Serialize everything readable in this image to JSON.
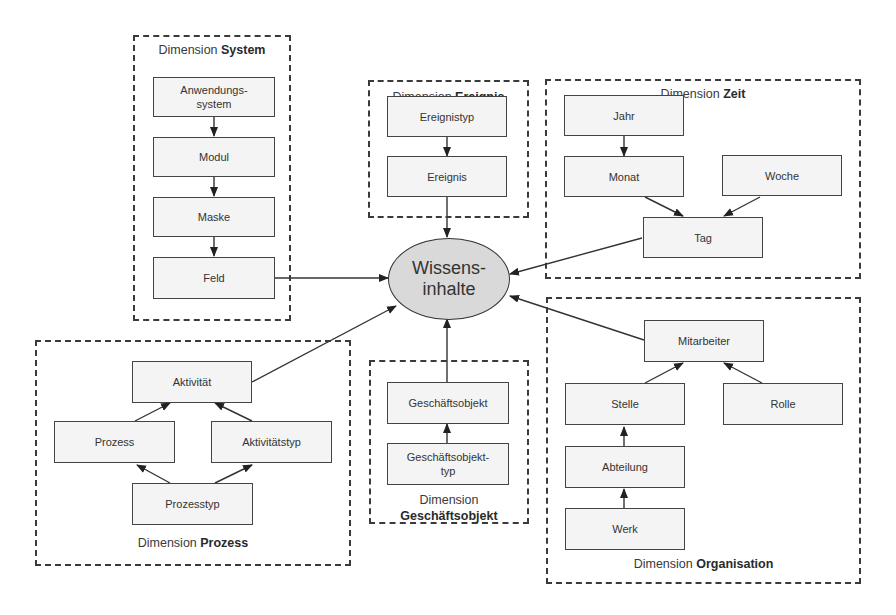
{
  "center": {
    "label": "Wissens-\ninhalte"
  },
  "dimensions": {
    "system": {
      "prefix": "Dimension ",
      "name": "System",
      "nodes": [
        "Anwendungs-\nsystem",
        "Modul",
        "Maske",
        "Feld"
      ]
    },
    "ereignis": {
      "prefix": "Dimension ",
      "name": "Ereignis",
      "nodes": [
        "Ereignistyp",
        "Ereignis"
      ]
    },
    "zeit": {
      "prefix": "Dimension ",
      "name": "Zeit",
      "nodes": [
        "Jahr",
        "Monat",
        "Woche",
        "Tag"
      ]
    },
    "prozess": {
      "prefix": "Dimension ",
      "name": "Prozess",
      "nodes": [
        "Aktivität",
        "Prozess",
        "Aktivitätstyp",
        "Prozesstyp"
      ]
    },
    "geschaeftsobjekt": {
      "prefix": "Dimension",
      "name": "Geschäftsobjekt",
      "nodes": [
        "Geschäftsobjekt",
        "Geschäftsobjekt-\ntyp"
      ]
    },
    "organisation": {
      "prefix": "Dimension ",
      "name": "Organisation",
      "nodes": [
        "Mitarbeiter",
        "Stelle",
        "Rolle",
        "Abteilung",
        "Werk"
      ]
    }
  },
  "edges": [
    [
      "Anwendungssystem",
      "Modul"
    ],
    [
      "Modul",
      "Maske"
    ],
    [
      "Maske",
      "Feld"
    ],
    [
      "Feld",
      "Wissensinhalte"
    ],
    [
      "Ereignistyp",
      "Ereignis"
    ],
    [
      "Ereignis",
      "Wissensinhalte"
    ],
    [
      "Jahr",
      "Monat"
    ],
    [
      "Monat",
      "Tag"
    ],
    [
      "Woche",
      "Tag"
    ],
    [
      "Tag",
      "Wissensinhalte"
    ],
    [
      "Prozesstyp",
      "Prozess"
    ],
    [
      "Prozesstyp",
      "Aktivitätstyp"
    ],
    [
      "Prozess",
      "Aktivität"
    ],
    [
      "Aktivitätstyp",
      "Aktivität"
    ],
    [
      "Aktivität",
      "Wissensinhalte"
    ],
    [
      "Geschäftsobjekttyp",
      "Geschäftsobjekt"
    ],
    [
      "Geschäftsobjekt",
      "Wissensinhalte"
    ],
    [
      "Werk",
      "Abteilung"
    ],
    [
      "Abteilung",
      "Stelle"
    ],
    [
      "Stelle",
      "Mitarbeiter"
    ],
    [
      "Rolle",
      "Mitarbeiter"
    ],
    [
      "Mitarbeiter",
      "Wissensinhalte"
    ]
  ],
  "colors": {
    "ellipse_fill": "#d9d9d9",
    "node_fill": "#f4f4f4",
    "line": "#333333"
  }
}
